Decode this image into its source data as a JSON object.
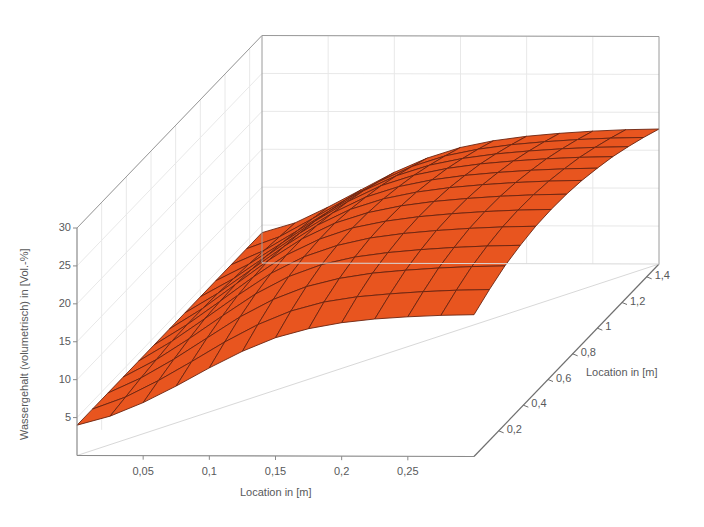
{
  "chart_data": {
    "type": "surface",
    "title": "",
    "xlabel": "Location in [m]",
    "ylabel": "Location in [m]",
    "zlabel": "Wassergehalt (volumetrisch) in [Vol.-%]",
    "x_ticks": [
      "0,05",
      "0,1",
      "0,15",
      "0,2",
      "0,25"
    ],
    "x_tick_values": [
      0.05,
      0.1,
      0.15,
      0.2,
      0.25
    ],
    "y_ticks": [
      "0,2",
      "0,4",
      "0,6",
      "0,8",
      "1",
      "1,2",
      "1,4"
    ],
    "y_tick_values": [
      0.2,
      0.4,
      0.6,
      0.8,
      1.0,
      1.2,
      1.4
    ],
    "z_ticks": [
      "5",
      "10",
      "15",
      "20",
      "25",
      "30"
    ],
    "z_tick_values": [
      5,
      10,
      15,
      20,
      25,
      30
    ],
    "xlim": [
      0,
      0.3
    ],
    "ylim": [
      0,
      1.5
    ],
    "zlim": [
      0,
      30
    ],
    "grid": true,
    "legend": "none",
    "surface_color": "#E8551F",
    "mesh_line_color": "#6B2410",
    "box_line_color": "#9a9a9a",
    "grid_line_color": "#e8e8e8",
    "text_color": "#58595b",
    "x": [
      0.0,
      0.025,
      0.05,
      0.075,
      0.1,
      0.125,
      0.15,
      0.175,
      0.2,
      0.225,
      0.25,
      0.275,
      0.3
    ],
    "y": [
      0.0,
      0.125,
      0.25,
      0.375,
      0.5,
      0.625,
      0.75,
      0.875,
      1.0,
      1.125,
      1.25,
      1.375,
      1.5
    ],
    "z": [
      [
        4.0,
        5.2,
        7.0,
        9.2,
        11.6,
        13.8,
        15.6,
        16.8,
        17.6,
        18.1,
        18.4,
        18.6,
        18.7
      ],
      [
        4.0,
        5.6,
        7.8,
        10.3,
        12.9,
        15.2,
        17.0,
        18.2,
        18.9,
        19.3,
        19.6,
        19.8,
        19.9
      ],
      [
        4.0,
        6.0,
        8.5,
        11.3,
        14.1,
        16.4,
        18.1,
        19.2,
        19.9,
        20.3,
        20.6,
        20.8,
        20.9
      ],
      [
        4.0,
        6.3,
        9.1,
        12.1,
        15.0,
        17.3,
        18.9,
        19.9,
        20.5,
        20.9,
        21.2,
        21.4,
        21.5
      ],
      [
        4.0,
        6.6,
        9.6,
        12.7,
        15.6,
        17.8,
        19.3,
        20.3,
        20.9,
        21.3,
        21.6,
        21.8,
        21.9
      ],
      [
        4.0,
        6.7,
        9.8,
        13.0,
        15.9,
        18.0,
        19.5,
        20.4,
        21.0,
        21.4,
        21.7,
        21.9,
        22.0
      ],
      [
        4.0,
        6.7,
        9.9,
        13.1,
        15.9,
        18.0,
        19.4,
        20.3,
        20.9,
        21.3,
        21.6,
        21.8,
        21.9
      ],
      [
        4.0,
        6.6,
        9.7,
        12.8,
        15.6,
        17.7,
        19.1,
        20.0,
        20.6,
        21.0,
        21.3,
        21.5,
        21.6
      ],
      [
        4.0,
        6.4,
        9.4,
        12.4,
        15.1,
        17.2,
        18.6,
        19.5,
        20.1,
        20.5,
        20.8,
        21.0,
        21.1
      ],
      [
        4.0,
        6.2,
        9.0,
        11.9,
        14.5,
        16.6,
        18.0,
        18.9,
        19.5,
        19.9,
        20.2,
        20.4,
        20.5
      ],
      [
        4.0,
        5.9,
        8.5,
        11.2,
        13.8,
        15.8,
        17.2,
        18.1,
        18.7,
        19.1,
        19.4,
        19.6,
        19.7
      ],
      [
        4.0,
        5.6,
        8.0,
        10.5,
        12.9,
        14.9,
        16.3,
        17.2,
        17.8,
        18.2,
        18.5,
        18.7,
        18.8
      ],
      [
        4.0,
        5.3,
        7.4,
        9.7,
        12.0,
        13.9,
        15.3,
        16.2,
        16.8,
        17.2,
        17.5,
        17.7,
        17.8
      ]
    ]
  },
  "axes": {
    "z_title": "Wassergehalt (volumetrisch) in [Vol.-%]",
    "x_title": "Location in [m]",
    "y_title": "Location in [m]"
  }
}
